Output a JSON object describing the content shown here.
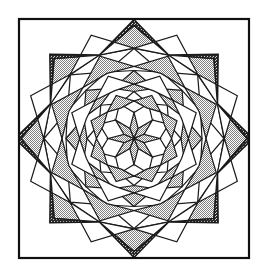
{
  "figure": {
    "caption": "",
    "alt": "Line drawing of an eight-pointed feathered star quilt block inside a square frame"
  },
  "canvas": {
    "width": 265,
    "height": 277,
    "background": "#ffffff"
  },
  "frame": {
    "name": "square-border",
    "x": 19,
    "y": 19,
    "width": 230,
    "height": 239,
    "stroke": "#111111",
    "stroke_width": 2.2,
    "fill": "#ffffff"
  },
  "geometry": {
    "center_x": 134,
    "center_y": 138.5,
    "points": 8,
    "rotation_step_deg": 45,
    "tip_radius": 119,
    "ring_radii": [
      26,
      47,
      68,
      90,
      113
    ],
    "half_angle_deg": 22.5
  },
  "palette": {
    "white": "#ffffff",
    "light_gray": "#c9c9c9",
    "mid_gray": "#b4b4b4",
    "dark_gray": "#6a6a6a",
    "line": "#1a1a1a"
  },
  "legend": {
    "entries": [
      {
        "key": "white",
        "label": "White patch",
        "color": "#ffffff"
      },
      {
        "key": "light_gray",
        "label": "Light stipple patch",
        "color": "#c9c9c9"
      },
      {
        "key": "dark_gray",
        "label": "Dark crosshatch patch",
        "color": "#6a6a6a"
      }
    ]
  },
  "layers": [
    {
      "name": "corner-squares",
      "count": 4,
      "fill": "white"
    },
    {
      "name": "outer-dark-triangles",
      "count": 8,
      "fill": "dark_gray"
    },
    {
      "name": "outer-chevron-ring",
      "count": 8,
      "fill": "light_gray"
    },
    {
      "name": "middle-chevron-ring",
      "count": 8,
      "fill": "white"
    },
    {
      "name": "inner-chevron-ring",
      "count": 8,
      "fill": "light_gray"
    },
    {
      "name": "center-star",
      "count": 8,
      "fill": "light_gray"
    }
  ],
  "stroke": {
    "outline_width": 1.5,
    "detail_width": 1.2
  }
}
